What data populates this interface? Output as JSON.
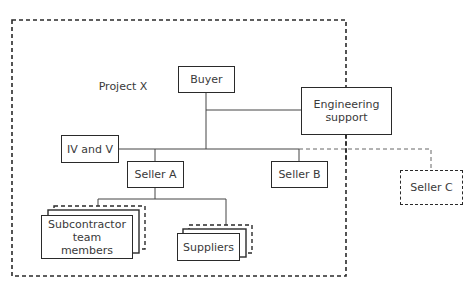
{
  "diagram": {
    "container_label": "Project X",
    "nodes": {
      "buyer": "Buyer",
      "engineering_support": "Engineering support",
      "iv_and_v": "IV and V",
      "seller_a": "Seller A",
      "seller_b": "Seller B",
      "seller_c": "Seller C",
      "subcontractor_team_members": "Subcontractor team members",
      "suppliers": "Suppliers"
    },
    "edges": [
      {
        "from": "Buyer",
        "to": "Engineering support",
        "style": "solid"
      },
      {
        "from": "Buyer",
        "to": "IV and V",
        "style": "solid"
      },
      {
        "from": "Buyer",
        "to": "Seller A",
        "style": "solid"
      },
      {
        "from": "Buyer",
        "to": "Seller B",
        "style": "solid"
      },
      {
        "from": "Buyer",
        "to": "Seller C",
        "style": "dashed"
      },
      {
        "from": "Seller A",
        "to": "Subcontractor team members",
        "style": "solid"
      },
      {
        "from": "Seller A",
        "to": "Suppliers",
        "style": "solid"
      }
    ],
    "colors": {
      "line": "#2a2a2a",
      "text": "#3a3a3a",
      "background": "#ffffff"
    }
  }
}
